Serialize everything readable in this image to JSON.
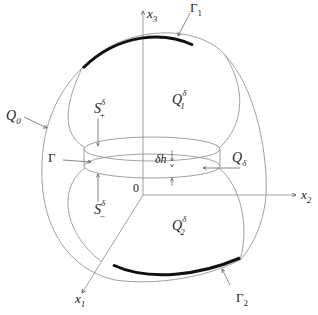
{
  "diagram": {
    "axes": {
      "x1": {
        "label": "x",
        "sub": "1"
      },
      "x2": {
        "label": "x",
        "sub": "2"
      },
      "x3": {
        "label": "x",
        "sub": "3"
      },
      "origin": "0"
    },
    "regions": {
      "Q0": {
        "label": "Q",
        "sub": "0"
      },
      "Q1d": {
        "label": "Q",
        "sub": "1",
        "sup": "δ"
      },
      "Q2d": {
        "label": "Q",
        "sub": "2",
        "sup": "δ"
      },
      "Qd": {
        "label": "Q",
        "sub": "δ"
      }
    },
    "boundaries": {
      "Gamma": "Γ",
      "Gamma1": {
        "label": "Γ",
        "sub": "1"
      },
      "Gamma2": {
        "label": "Γ",
        "sub": "2"
      },
      "Splus": {
        "label": "S",
        "sub": "+",
        "sup": "δ"
      },
      "Sminus": {
        "label": "S",
        "sub": "−",
        "sup": "δ"
      }
    },
    "thickness": "δh",
    "colors": {
      "line": "#777777",
      "bold": "#111111",
      "text": "#222222"
    }
  }
}
